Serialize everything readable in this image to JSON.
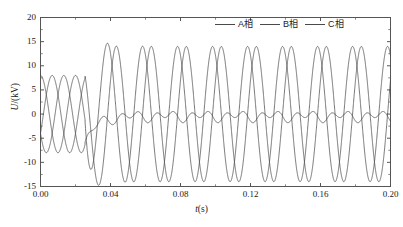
{
  "chart_data": {
    "type": "line",
    "title": "",
    "subtitle": "",
    "xlabel": "t(s)",
    "ylabel": "U/(kV)",
    "xlim": [
      0.0,
      0.2
    ],
    "ylim": [
      -15,
      20
    ],
    "xticks": [
      "0.00",
      "0.04",
      "0.08",
      "0.12",
      "0.16",
      "0.20"
    ],
    "xtick_values": [
      0.0,
      0.04,
      0.08,
      0.12,
      0.16,
      0.2
    ],
    "yticks": [
      "20",
      "15",
      "10",
      "5",
      "0",
      "-5",
      "-10",
      "-15"
    ],
    "ytick_values": [
      20,
      15,
      10,
      5,
      0,
      -5,
      -10,
      -15
    ],
    "grid": false,
    "legend_position": "top-right",
    "legend": [
      "A相",
      "B相",
      "C相"
    ],
    "line_color": "#4a4a4a",
    "frame_color": "#555555",
    "fault_time": 0.0255,
    "frequency_hz": 50,
    "series": [
      {
        "name": "A相",
        "prefault_amplitude": 8.0,
        "prefault_phase_deg": 90,
        "postfault_amplitude": 14.0,
        "postfault_phase_deg": 120,
        "transient_overshoot": 15.3
      },
      {
        "name": "B相",
        "prefault_amplitude": 8.0,
        "prefault_phase_deg": -30,
        "postfault_amplitude": 14.0,
        "postfault_phase_deg": 30,
        "transient_overshoot": 14.6
      },
      {
        "name": "C相",
        "prefault_amplitude": 8.0,
        "prefault_phase_deg": -150,
        "postfault_amplitude": 0.8,
        "postfault_offset": -0.45,
        "postfault_ripple_hz": 100
      }
    ]
  }
}
